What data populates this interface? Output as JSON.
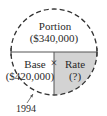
{
  "diagram": {
    "type": "percentage-circle",
    "top_section": {
      "label": "Portion",
      "value": "($340,000)"
    },
    "bottom_left": {
      "label": "Base",
      "value": "($420,000)"
    },
    "bottom_right": {
      "label": "Rate",
      "value": "(?)"
    },
    "operator": "×",
    "annotation": "1994",
    "colors": {
      "shade": "#d3d3d3",
      "line": "#333333"
    }
  }
}
